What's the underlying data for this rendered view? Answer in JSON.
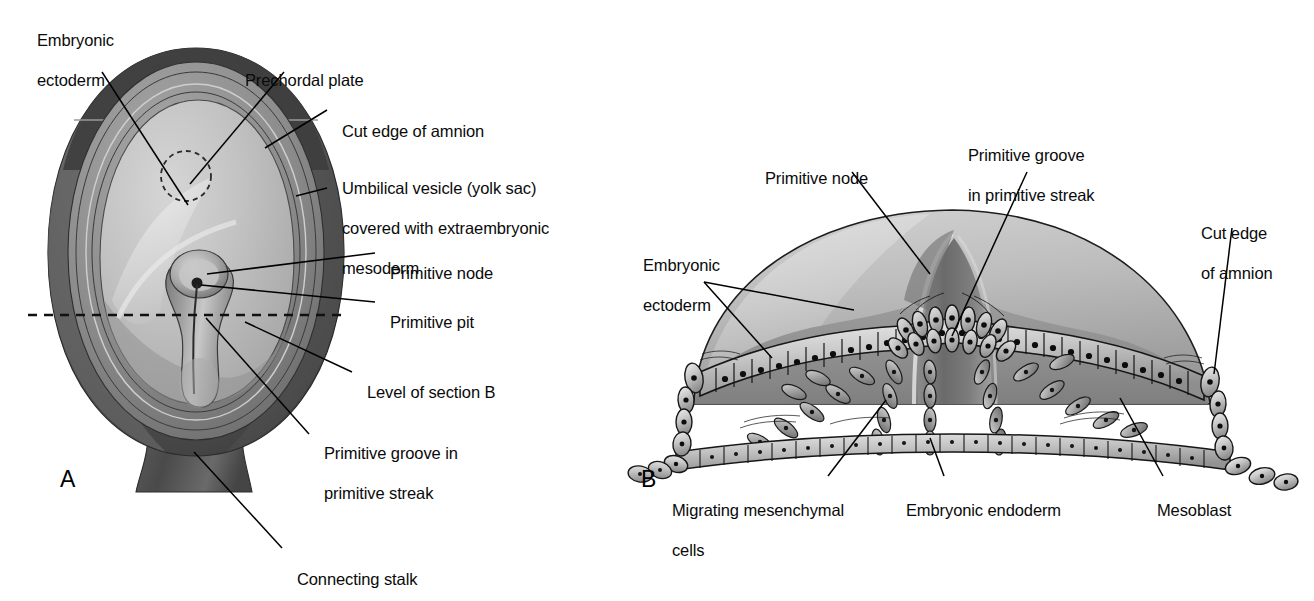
{
  "figure": {
    "type": "anatomical-illustration",
    "panels": [
      {
        "id": "A",
        "letter": "A",
        "x": 60,
        "y": 466
      },
      {
        "id": "B",
        "letter": "B",
        "x": 641,
        "y": 466
      }
    ]
  },
  "panelA": {
    "labels": [
      {
        "key": "embryonic_ectoderm",
        "text": "Embryonic\nectoderm",
        "x": 28,
        "y": 18,
        "lines": [
          "Embryonic",
          "ectoderm"
        ]
      },
      {
        "key": "prechordal_plate",
        "text": "Prechordal plate",
        "x": 236,
        "y": 52,
        "lines": [
          "Prechordal plate"
        ]
      },
      {
        "key": "cut_edge_of_amnion",
        "text": "Cut edge of amnion",
        "x": 333,
        "y": 105,
        "lines": [
          "Cut edge of amnion"
        ]
      },
      {
        "key": "umbilical_vesicle",
        "text": "Umbilical vesicle (yolk sac)\ncovered with extraembryonic\nmesoderm",
        "x": 333,
        "y": 163,
        "lines": [
          "Umbilical vesicle (yolk sac)",
          "covered with extraembryonic",
          "mesoderm"
        ]
      },
      {
        "key": "primitive_node",
        "text": "Primitive node",
        "x": 381,
        "y": 246,
        "lines": [
          "Primitive node"
        ]
      },
      {
        "key": "primitive_pit",
        "text": "Primitive pit",
        "x": 381,
        "y": 296,
        "lines": [
          "Primitive pit"
        ]
      },
      {
        "key": "level_of_section_b",
        "text": "Level of section B",
        "x": 358,
        "y": 366,
        "lines": [
          "Level of section B"
        ]
      },
      {
        "key": "primitive_groove",
        "text": "Primitive groove in\nprimitive streak",
        "x": 315,
        "y": 427,
        "lines": [
          "Primitive groove in",
          "primitive streak"
        ]
      },
      {
        "key": "connecting_stalk",
        "text": "Connecting stalk",
        "x": 288,
        "y": 556,
        "lines": [
          "Connecting stalk"
        ]
      }
    ]
  },
  "panelB": {
    "labels": [
      {
        "key": "primitive_node",
        "text": "Primitive node",
        "x": 756,
        "y": 152,
        "lines": [
          "Primitive node"
        ]
      },
      {
        "key": "primitive_groove",
        "text": "Primitive groove\nin primitive streak",
        "x": 959,
        "y": 129,
        "lines": [
          "Primitive groove",
          "in primitive streak"
        ]
      },
      {
        "key": "cut_edge_of_amnion",
        "text": "Cut edge\nof amnion",
        "x": 1192,
        "y": 207,
        "lines": [
          "Cut edge",
          "of amnion"
        ]
      },
      {
        "key": "embryonic_ectoderm",
        "text": "Embryonic\nectoderm",
        "x": 634,
        "y": 239,
        "lines": [
          "Embryonic",
          "ectoderm"
        ]
      },
      {
        "key": "migrating_mesenchymal_cells",
        "text": "Migrating mesenchymal\ncells",
        "x": 663,
        "y": 487,
        "lines": [
          "Migrating mesenchymal",
          "cells"
        ]
      },
      {
        "key": "embryonic_endoderm",
        "text": "Embryonic endoderm",
        "x": 897,
        "y": 487,
        "lines": [
          "Embryonic endoderm"
        ]
      },
      {
        "key": "mesoblast",
        "text": "Mesoblast",
        "x": 1148,
        "y": 487,
        "lines": [
          "Mesoblast"
        ]
      }
    ]
  },
  "colors": {
    "text": "#0a0a0a",
    "leader_line": "#000000",
    "outer_dark": "#4a4a4a",
    "outer_mid": "#6e6e6e",
    "amnion_ring": "#8d8d8d",
    "disc_light": "#b9b9b9",
    "disc_pale": "#d0d0d0",
    "cell_fill": "#cfcfcf",
    "cell_dark": "#8a8a8a",
    "dome_light": "#c4c4c4",
    "dome_mid": "#a6a6a6",
    "dome_dark": "#7b7b7b",
    "background": "#ffffff"
  }
}
